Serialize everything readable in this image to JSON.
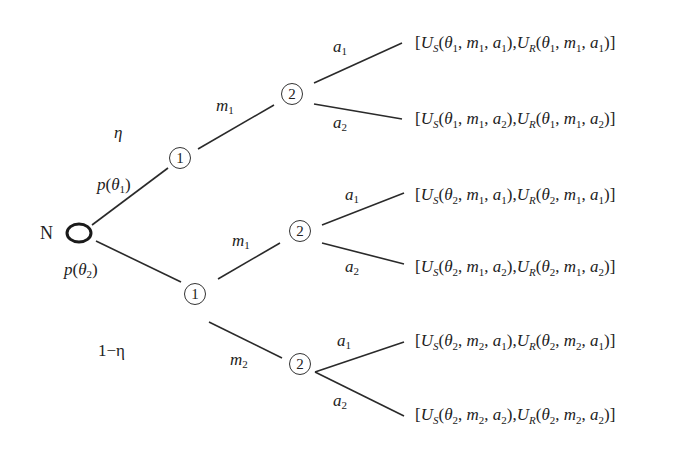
{
  "diagram": {
    "type": "signaling-game-tree",
    "nature_node": {
      "label": "N"
    },
    "probabilities": {
      "upper_branch": "p(θ1)",
      "lower_branch": "p(θ2)",
      "eta_label": "η",
      "one_minus_eta_label": "1−η"
    },
    "sender_nodes": [
      {
        "id": "S1",
        "label": "1",
        "type": "θ1"
      },
      {
        "id": "S2",
        "label": "1",
        "type": "θ2"
      }
    ],
    "receiver_nodes": [
      {
        "id": "R1",
        "label": "2"
      },
      {
        "id": "R2",
        "label": "2"
      },
      {
        "id": "R3",
        "label": "2"
      }
    ],
    "messages": [
      {
        "from": "S1",
        "to": "R1",
        "label": "m",
        "sub": "1"
      },
      {
        "from": "S2",
        "to": "R2",
        "label": "m",
        "sub": "1"
      },
      {
        "from": "S2",
        "to": "R3",
        "label": "m",
        "sub": "2"
      }
    ],
    "actions": [
      {
        "from": "R1",
        "label": "a",
        "sub": "1"
      },
      {
        "from": "R1",
        "label": "a",
        "sub": "2"
      },
      {
        "from": "R2",
        "label": "a",
        "sub": "1"
      },
      {
        "from": "R2",
        "label": "a",
        "sub": "2"
      },
      {
        "from": "R3",
        "label": "a",
        "sub": "1"
      },
      {
        "from": "R3",
        "label": "a",
        "sub": "2"
      }
    ],
    "payoffs": [
      {
        "theta": "1",
        "m": "1",
        "a": "1"
      },
      {
        "theta": "1",
        "m": "1",
        "a": "2"
      },
      {
        "theta": "2",
        "m": "1",
        "a": "1"
      },
      {
        "theta": "2",
        "m": "1",
        "a": "2"
      },
      {
        "theta": "2",
        "m": "2",
        "a": "1"
      },
      {
        "theta": "2",
        "m": "2",
        "a": "2"
      }
    ],
    "symbols": {
      "U": "U",
      "S": "S",
      "R": "R",
      "theta": "θ",
      "m": "m",
      "a": "a",
      "open_bracket": "[",
      "close_bracket": "]",
      "open_paren": "(",
      "close_paren": ")",
      "comma": ", ",
      "p": "p"
    }
  }
}
